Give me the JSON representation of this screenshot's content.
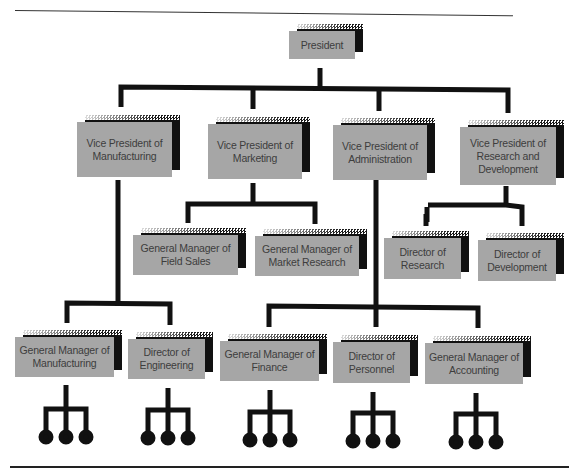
{
  "diagram": {
    "type": "organizational-chart",
    "colors": {
      "box_fill": "#a6a6a6",
      "box_text": "#3d3d3d",
      "shadow": "#111111",
      "line": "#111111",
      "background": "#ffffff"
    },
    "nodes": {
      "president": {
        "label": "President"
      },
      "vp_manufacturing": {
        "label": "Vice President of Manufacturing"
      },
      "vp_marketing": {
        "label": "Vice President of Marketing"
      },
      "vp_administration": {
        "label": "Vice President of Administration"
      },
      "vp_research": {
        "label": "Vice President of Research and Development"
      },
      "gm_field_sales": {
        "label": "General Manager of Field Sales"
      },
      "gm_market_research": {
        "label": "General Manager of Market Research"
      },
      "dir_research": {
        "label": "Director of Research"
      },
      "dir_development": {
        "label": "Director of Development"
      },
      "gm_manufacturing": {
        "label": "General Manager of Manufacturing"
      },
      "dir_engineering": {
        "label": "Director of Engineering"
      },
      "gm_finance": {
        "label": "General Manager of Finance"
      },
      "dir_personnel": {
        "label": "Director of Personnel"
      },
      "gm_accounting": {
        "label": "General Manager of Accounting"
      }
    },
    "edges": [
      [
        "president",
        "vp_manufacturing"
      ],
      [
        "president",
        "vp_marketing"
      ],
      [
        "president",
        "vp_administration"
      ],
      [
        "president",
        "vp_research"
      ],
      [
        "vp_marketing",
        "gm_field_sales"
      ],
      [
        "vp_marketing",
        "gm_market_research"
      ],
      [
        "vp_research",
        "dir_research"
      ],
      [
        "vp_research",
        "dir_development"
      ],
      [
        "vp_manufacturing",
        "gm_manufacturing"
      ],
      [
        "vp_manufacturing",
        "dir_engineering"
      ],
      [
        "vp_administration",
        "gm_finance"
      ],
      [
        "vp_administration",
        "dir_personnel"
      ],
      [
        "vp_administration",
        "gm_accounting"
      ]
    ],
    "leaf_subordinate_symbols": {
      "count_per_bottom_node": 3,
      "icon": "three-circle-branch"
    }
  }
}
